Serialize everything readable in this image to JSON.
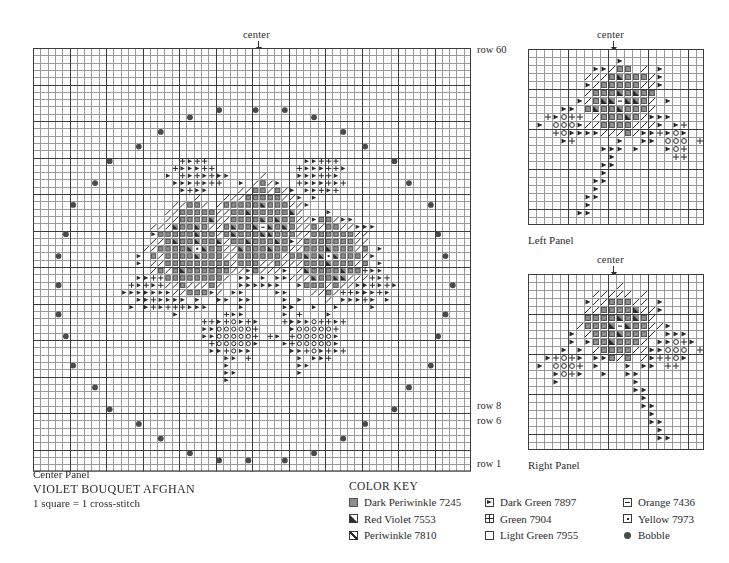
{
  "document": {
    "title": "VIOLET BOUQUET AFGHAN",
    "scale_note": "1 square = 1 cross-stitch"
  },
  "labels": {
    "center": "center",
    "center_panel": "Center Panel",
    "left_panel": "Left Panel",
    "right_panel": "Right Panel",
    "row60": "row 60",
    "row8": "row 8",
    "row6": "row 6",
    "row1": "row 1"
  },
  "color_key": {
    "heading": "COLOR KEY",
    "columns": [
      [
        {
          "symbol": "dark-periwinkle",
          "label": "Dark Periwinkle 7245"
        },
        {
          "symbol": "red-violet",
          "label": "Red Violet 7553"
        },
        {
          "symbol": "periwinkle",
          "label": "Periwinkle 7810"
        }
      ],
      [
        {
          "symbol": "dark-green",
          "label": "Dark Green 7897"
        },
        {
          "symbol": "green",
          "label": "Green 7904"
        },
        {
          "symbol": "light-green",
          "label": "Light Green 7955"
        }
      ],
      [
        {
          "symbol": "orange",
          "label": "Orange 7436"
        },
        {
          "symbol": "yellow",
          "label": "Yellow 7973"
        },
        {
          "symbol": "bobble",
          "label": "Bobble"
        }
      ]
    ]
  },
  "colors": {
    "grid_minor": "#9a9a9a",
    "grid_major": "#3c3c3c",
    "ink": "#2b2b2b",
    "fill_gray": "#8d8d8d",
    "bobble": "#4a4a4a",
    "paper": "#ffffff"
  },
  "chart_data": {
    "type": "heatmap",
    "title": "VIOLET BOUQUET AFGHAN",
    "subtitle": "1 square = 1 cross-stitch",
    "legend_position": "bottom",
    "grid": true,
    "symbol_legend": {
      "D": "Dark Periwinkle 7245",
      "R": "Red Violet 7553",
      "P": "Periwinkle 7810",
      "G": "Dark Green 7897",
      "g": "Green 7904",
      "L": "Light Green 7955",
      "O": "Orange 7436",
      "Y": "Yellow 7973",
      "B": "Bobble"
    },
    "panels": [
      {
        "name": "Center Panel",
        "cols": 60,
        "rows": 58,
        "major_every": 5,
        "center_col": 30,
        "row_ticks": [
          {
            "row_from_bottom": 58,
            "label": "row 60"
          },
          {
            "row_from_bottom": 8,
            "label": "row 8"
          },
          {
            "row_from_bottom": 6,
            "label": "row 6"
          },
          {
            "row_from_bottom": 1,
            "label": "row 1"
          }
        ],
        "bobble_ring": {
          "shape": "ellipse-outline",
          "cx": 29.5,
          "cy": 26.0,
          "rx": 27.0,
          "ry": 24.0,
          "count": 40
        },
        "motif": {
          "description": "violet bouquet: three blossoms with leaves and stems",
          "bbox": [
            13,
            10,
            46,
            44
          ],
          "flowers": [
            {
              "cx": 22,
              "cy": 31,
              "r": 7,
              "petal": "D",
              "accent": "P",
              "center": "Y"
            },
            {
              "cx": 31,
              "cy": 34,
              "r": 7,
              "petal": "D",
              "accent": "P",
              "center": "O"
            },
            {
              "cx": 40,
              "cy": 30,
              "r": 6,
              "petal": "D",
              "accent": "P",
              "center": "Y"
            }
          ],
          "leaf_clusters": [
            {
              "cx": 17,
              "cy": 25,
              "r": 5,
              "symbol": "G"
            },
            {
              "cx": 44,
              "cy": 26,
              "r": 5,
              "symbol": "G"
            },
            {
              "cx": 27,
              "cy": 19,
              "r": 5,
              "symbol": "L"
            },
            {
              "cx": 38,
              "cy": 19,
              "r": 5,
              "symbol": "L"
            },
            {
              "cx": 22,
              "cy": 41,
              "r": 4,
              "symbol": "g"
            },
            {
              "cx": 39,
              "cy": 41,
              "r": 4,
              "symbol": "g"
            }
          ],
          "stems": [
            {
              "from": [
                28,
                26
              ],
              "to": [
                26,
                13
              ],
              "symbol": "G"
            },
            {
              "from": [
                33,
                27
              ],
              "to": [
                36,
                14
              ],
              "symbol": "G"
            }
          ]
        }
      },
      {
        "name": "Left Panel",
        "cols": 22,
        "rows": 22,
        "major_every": 5,
        "center_col": 11,
        "motif": {
          "description": "single violet blossom with leaves and stem",
          "flowers": [
            {
              "cx": 11,
              "cy": 16,
              "r": 5,
              "petal": "D",
              "accent": "P",
              "center": "O"
            }
          ],
          "leaf_clusters": [
            {
              "cx": 4,
              "cy": 13,
              "r": 3,
              "symbol": "L"
            },
            {
              "cx": 18,
              "cy": 11,
              "r": 3,
              "symbol": "L"
            }
          ],
          "stems": [
            {
              "from": [
                11,
                12
              ],
              "to": [
                6,
                2
              ],
              "symbol": "G"
            }
          ]
        }
      },
      {
        "name": "Right Panel",
        "cols": 22,
        "rows": 22,
        "major_every": 5,
        "center_col": 11,
        "mirror_of": "Left Panel",
        "motif": {
          "description": "single violet blossom with leaves and stem (mirrored)",
          "flowers": [
            {
              "cx": 11,
              "cy": 16,
              "r": 5,
              "petal": "D",
              "accent": "P",
              "center": "O"
            }
          ],
          "leaf_clusters": [
            {
              "cx": 18,
              "cy": 13,
              "r": 3,
              "symbol": "L"
            },
            {
              "cx": 4,
              "cy": 11,
              "r": 3,
              "symbol": "L"
            }
          ],
          "stems": [
            {
              "from": [
                11,
                12
              ],
              "to": [
                16,
                2
              ],
              "symbol": "G"
            }
          ]
        }
      }
    ]
  }
}
